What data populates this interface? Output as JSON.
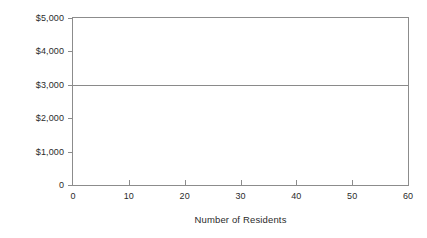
{
  "chart_data": {
    "type": "line",
    "title": "",
    "xlabel": "Number of Residents",
    "ylabel": "Total Monthly Fixed Cost",
    "xlim": [
      0,
      60
    ],
    "ylim": [
      0,
      5000
    ],
    "grid": false,
    "legend": false,
    "x_ticks": [
      {
        "value": 0,
        "label": "0"
      },
      {
        "value": 10,
        "label": "10"
      },
      {
        "value": 20,
        "label": "20"
      },
      {
        "value": 30,
        "label": "30"
      },
      {
        "value": 40,
        "label": "40"
      },
      {
        "value": 50,
        "label": "50"
      },
      {
        "value": 60,
        "label": "60"
      }
    ],
    "y_ticks": [
      {
        "value": 0,
        "label": "0"
      },
      {
        "value": 1000,
        "label": "$1,000"
      },
      {
        "value": 2000,
        "label": "$2,000"
      },
      {
        "value": 3000,
        "label": "$3,000"
      },
      {
        "value": 4000,
        "label": "$4,000"
      },
      {
        "value": 5000,
        "label": "$5,000"
      }
    ],
    "series": [
      {
        "name": "Total Monthly Fixed Cost",
        "color": "#8a8a8a",
        "x": [
          0,
          60
        ],
        "values": [
          3000,
          3000
        ]
      }
    ]
  }
}
